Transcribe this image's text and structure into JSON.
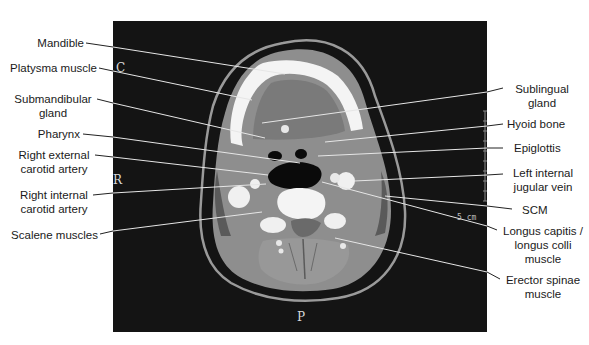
{
  "figure": {
    "orientation_markers": {
      "anterior": "C",
      "right": "R",
      "posterior": "P"
    },
    "scale_bar": {
      "label": "5 cm"
    },
    "labels_left": [
      {
        "id": "mandible",
        "text": "Mandible"
      },
      {
        "id": "platysma",
        "text": "Platysma muscle"
      },
      {
        "id": "submandibular",
        "line1": "Submandibular",
        "line2": "gland"
      },
      {
        "id": "pharynx",
        "text": "Pharynx"
      },
      {
        "id": "right-external-carotid",
        "line1": "Right external",
        "line2": "carotid artery"
      },
      {
        "id": "right-internal-carotid",
        "line1": "Right internal",
        "line2": "carotid artery"
      },
      {
        "id": "scalene",
        "text": "Scalene muscles"
      }
    ],
    "labels_right": [
      {
        "id": "sublingual",
        "line1": "Sublingual",
        "line2": "gland"
      },
      {
        "id": "hyoid",
        "text": "Hyoid bone"
      },
      {
        "id": "epiglottis",
        "text": "Epiglottis"
      },
      {
        "id": "left-internal-jugular",
        "line1": "Left internal",
        "line2": "jugular vein"
      },
      {
        "id": "scm",
        "text": "SCM"
      },
      {
        "id": "longus",
        "line1": "Longus capitis /",
        "line2": "longus colli",
        "line3": "muscle"
      },
      {
        "id": "erector-spinae",
        "line1": "Erector spinae",
        "line2": "muscle"
      }
    ],
    "colors": {
      "panel_background": "#141414",
      "bone": "#f4f4f4",
      "soft_tissue": "#8e8e8e",
      "fat": "#4a4a4a",
      "air": "#0a0a0a",
      "leader_on_dark": "#e6e6e6",
      "leader_on_light": "#222222"
    }
  }
}
